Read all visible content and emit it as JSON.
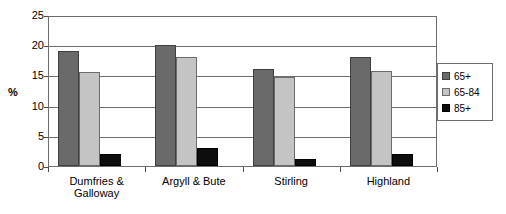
{
  "chart_data": {
    "type": "bar",
    "title": "",
    "xlabel": "",
    "ylabel": "%",
    "ylim": [
      0,
      25
    ],
    "yticks": [
      0,
      5,
      10,
      15,
      20,
      25
    ],
    "grid": true,
    "legend_position": "right",
    "categories": [
      "Dumfries & Galloway",
      "Argyll & Bute",
      "Stirling",
      "Highland"
    ],
    "category_lines": [
      [
        "Dumfries &",
        "Galloway"
      ],
      [
        "Argyll & Bute"
      ],
      [
        "Stirling"
      ],
      [
        "Highland"
      ]
    ],
    "series": [
      {
        "name": "65+",
        "color": "#6a6a6a",
        "values": [
          19.0,
          20.0,
          16.0,
          18.0
        ]
      },
      {
        "name": "65-84",
        "color": "#c4c4c4",
        "values": [
          15.5,
          18.0,
          14.8,
          15.8
        ]
      },
      {
        "name": "85+",
        "color": "#0d0d0d",
        "values": [
          2.0,
          3.0,
          1.1,
          2.0
        ]
      }
    ]
  }
}
